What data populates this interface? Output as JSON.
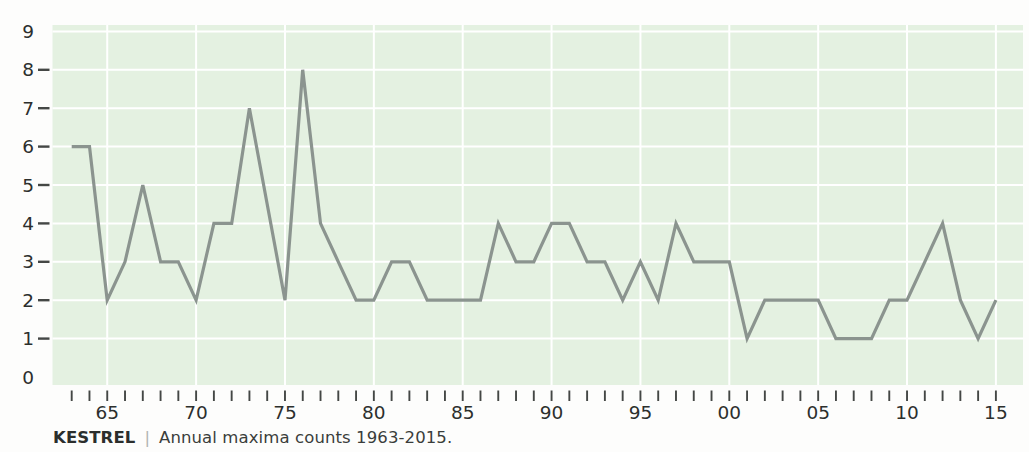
{
  "caption": {
    "species": "KESTREL",
    "separator": "|",
    "description": "Annual maxima counts 1963-2015."
  },
  "colors": {
    "plot_bg": "#e4f1e1",
    "line": "#8b948f",
    "grid": "#ffffff",
    "tick": "#444745",
    "axis_label": "#2c2f2d",
    "page_bg": "#fdfdfc"
  },
  "chart_data": {
    "type": "line",
    "title": "KESTREL | Annual maxima counts 1963-2015.",
    "xlabel": "",
    "ylabel": "",
    "ylim": [
      0,
      9
    ],
    "y_tick_labels": [
      "0",
      "1",
      "2",
      "3",
      "4",
      "5",
      "6",
      "7",
      "8",
      "9"
    ],
    "y_dash_ticks": [
      1,
      2,
      3,
      4,
      5,
      6,
      7,
      8
    ],
    "grid": {
      "horizontal": true,
      "vertical_at_labeled_ticks": true
    },
    "legend": "none",
    "x_ticks_every_year": true,
    "x_ticks_labeled": [
      {
        "year": 1965,
        "label": "65"
      },
      {
        "year": 1970,
        "label": "70"
      },
      {
        "year": 1975,
        "label": "75"
      },
      {
        "year": 1980,
        "label": "80"
      },
      {
        "year": 1985,
        "label": "85"
      },
      {
        "year": 1990,
        "label": "90"
      },
      {
        "year": 1995,
        "label": "95"
      },
      {
        "year": 2000,
        "label": "00"
      },
      {
        "year": 2005,
        "label": "05"
      },
      {
        "year": 2010,
        "label": "10"
      },
      {
        "year": 2015,
        "label": "15"
      }
    ],
    "years": [
      1963,
      1964,
      1965,
      1966,
      1967,
      1968,
      1969,
      1970,
      1971,
      1972,
      1973,
      1974,
      1975,
      1976,
      1977,
      1978,
      1979,
      1980,
      1981,
      1982,
      1983,
      1984,
      1985,
      1986,
      1987,
      1988,
      1989,
      1990,
      1991,
      1992,
      1993,
      1994,
      1995,
      1996,
      1997,
      1998,
      1999,
      2000,
      2001,
      2002,
      2003,
      2004,
      2005,
      2006,
      2007,
      2008,
      2009,
      2010,
      2011,
      2012,
      2013,
      2014,
      2015
    ],
    "values": [
      6,
      6,
      2,
      3,
      5,
      3,
      3,
      2,
      4,
      4,
      7,
      4.5,
      2,
      8,
      4,
      3,
      2,
      2,
      3,
      3,
      2,
      2,
      2,
      2,
      4,
      3,
      3,
      4,
      4,
      3,
      3,
      2,
      3,
      2,
      4,
      3,
      3,
      3,
      1,
      2,
      2,
      2,
      2,
      1,
      1,
      1,
      2,
      2,
      3,
      4,
      2,
      1,
      2
    ]
  }
}
